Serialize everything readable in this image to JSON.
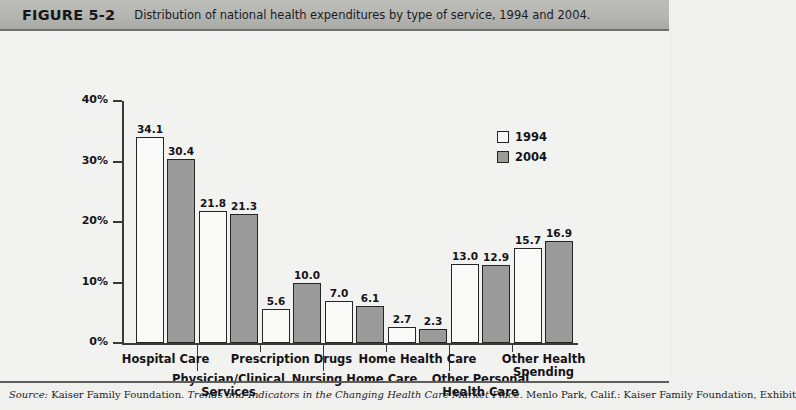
{
  "figure": {
    "number": "FIGURE 5-2",
    "caption": "Distribution of national health expenditures by type of service, 1994 and 2004."
  },
  "source": {
    "prefix": "Source:",
    "publisher": "Kaiser Family Foundation.",
    "title": "Trends and Indicators in the Changing Health Care Market Place",
    "rest": ". Menlo Park, Calif.: Kaiser Family Foundation, Exhibit"
  },
  "legend": {
    "position": "inside-top-right",
    "items": [
      {
        "label": "1994",
        "color": "#fafaf8",
        "key": "y1994"
      },
      {
        "label": "2004",
        "color": "#9b9b9b",
        "key": "y2004"
      }
    ]
  },
  "axis": {
    "y_ticks": [
      "0%",
      "10%",
      "20%",
      "30%",
      "40%"
    ],
    "y_values": [
      0,
      10,
      20,
      30,
      40
    ]
  },
  "chart_data": {
    "type": "bar",
    "title": "Distribution of national health expenditures by type of service, 1994 and 2004.",
    "xlabel": "",
    "ylabel": "",
    "ylim": [
      0,
      40
    ],
    "ytick_labels": [
      "0%",
      "10%",
      "20%",
      "30%",
      "40%"
    ],
    "grid": false,
    "legend_position": "inside-top-right",
    "categories": [
      "Hospital Care",
      "Physician/Clinical Services",
      "Prescription Drugs",
      "Nursing Home Care",
      "Home Health Care",
      "Other Personal Health Care",
      "Other Health Spending"
    ],
    "series": [
      {
        "name": "1994",
        "color": "#fafaf8",
        "values": [
          34.1,
          21.8,
          5.6,
          7.0,
          2.7,
          13.0,
          15.7
        ]
      },
      {
        "name": "2004",
        "color": "#9b9b9b",
        "values": [
          30.4,
          21.3,
          10.0,
          6.1,
          2.3,
          12.9,
          16.9
        ]
      }
    ]
  },
  "category_labels": [
    {
      "text": "Hospital Care",
      "row": 0
    },
    {
      "text": "Physician/Clinical\nServices",
      "row": 1
    },
    {
      "text": "Prescription Drugs",
      "row": 0
    },
    {
      "text": "Nursing Home Care",
      "row": 1
    },
    {
      "text": "Home Health Care",
      "row": 0
    },
    {
      "text": "Other Personal\nHealth Care",
      "row": 1
    },
    {
      "text": "Other Health\nSpending",
      "row": 0
    }
  ]
}
